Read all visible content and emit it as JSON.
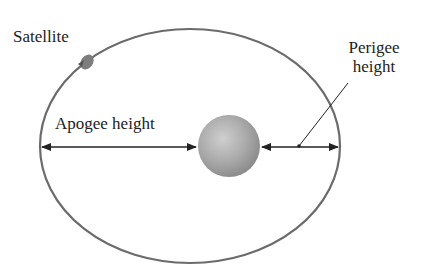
{
  "diagram": {
    "labels": {
      "satellite": "Satellite",
      "apogee": "Apogee height",
      "perigee_line1": "Perigee",
      "perigee_line2": "height"
    },
    "colors": {
      "orbit": "#6b6b6b",
      "earth": "#a8a8a8",
      "arrows": "#222222",
      "text": "#222222"
    }
  }
}
